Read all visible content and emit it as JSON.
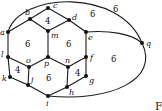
{
  "diagram": {
    "type": "planar-graph",
    "vertices": [
      {
        "id": "a",
        "label": "a",
        "x": 8,
        "y": 32
      },
      {
        "id": "b",
        "label": "b",
        "x": 30,
        "y": 19
      },
      {
        "id": "c",
        "label": "c",
        "x": 48,
        "y": 8
      },
      {
        "id": "d",
        "label": "d",
        "x": 69,
        "y": 20
      },
      {
        "id": "e",
        "label": "e",
        "x": 86,
        "y": 32
      },
      {
        "id": "q",
        "label": "q",
        "x": 142,
        "y": 43
      },
      {
        "id": "m",
        "label": "m",
        "x": 48,
        "y": 31
      },
      {
        "id": "l",
        "label": "l",
        "x": 8,
        "y": 57
      },
      {
        "id": "o",
        "label": "o",
        "x": 29,
        "y": 67
      },
      {
        "id": "p",
        "label": "p",
        "x": 48,
        "y": 57
      },
      {
        "id": "n",
        "label": "n",
        "x": 68,
        "y": 67
      },
      {
        "id": "f",
        "label": "f",
        "x": 86,
        "y": 57
      },
      {
        "id": "k",
        "label": "k",
        "x": 10,
        "y": 77
      },
      {
        "id": "j",
        "label": "j",
        "x": 28,
        "y": 85
      },
      {
        "id": "h",
        "label": "h",
        "x": 67,
        "y": 87
      },
      {
        "id": "g",
        "label": "g",
        "x": 86,
        "y": 76
      },
      {
        "id": "i",
        "label": "i",
        "x": 48,
        "y": 96
      }
    ],
    "edges": [
      [
        "a",
        "b"
      ],
      [
        "b",
        "c"
      ],
      [
        "c",
        "d"
      ],
      [
        "d",
        "e"
      ],
      [
        "b",
        "m"
      ],
      [
        "d",
        "m"
      ],
      [
        "m",
        "p"
      ],
      [
        "a",
        "l"
      ],
      [
        "l",
        "o"
      ],
      [
        "o",
        "p"
      ],
      [
        "p",
        "n"
      ],
      [
        "n",
        "f"
      ],
      [
        "e",
        "f"
      ],
      [
        "l",
        "k"
      ],
      [
        "k",
        "j"
      ],
      [
        "o",
        "j"
      ],
      [
        "j",
        "i"
      ],
      [
        "i",
        "h"
      ],
      [
        "n",
        "h"
      ],
      [
        "h",
        "g"
      ],
      [
        "f",
        "g"
      ],
      [
        "a",
        "q"
      ],
      [
        "e",
        "q"
      ],
      [
        "q",
        "i"
      ]
    ],
    "face_labels": [
      {
        "text": "4",
        "x": 46,
        "y": 23
      },
      {
        "text": "6",
        "x": 26,
        "y": 46
      },
      {
        "text": "6",
        "x": 66,
        "y": 46
      },
      {
        "text": "4",
        "x": 16,
        "y": 71
      },
      {
        "text": "6",
        "x": 46,
        "y": 79
      },
      {
        "text": "4",
        "x": 75,
        "y": 75
      },
      {
        "text": "6",
        "x": 92,
        "y": 18
      },
      {
        "text": "6",
        "x": 114,
        "y": 13
      },
      {
        "text": "6",
        "x": 111,
        "y": 60
      }
    ],
    "caption_fragment": "F"
  }
}
